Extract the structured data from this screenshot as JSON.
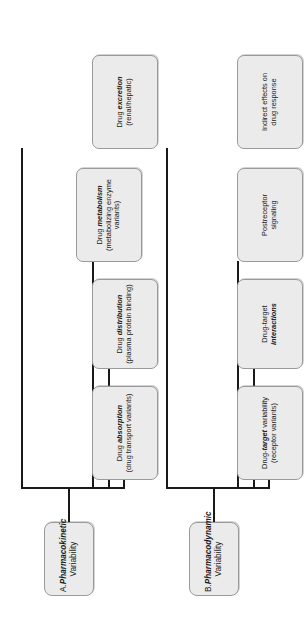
{
  "figure": {
    "orientation": "rotated-90-ccw",
    "box_fill": "#ebebeb",
    "box_border": "#9a9a9a",
    "line_color": "#1a1a1a",
    "background": "#ffffff"
  },
  "groups": [
    {
      "id": "A",
      "parent": {
        "label_prefix": "A.",
        "label_emphasis": "Pharmacokinetic",
        "label_rest": "Variability"
      },
      "children": [
        {
          "lead": "Drug ",
          "emphasis": "absorption",
          "sub": "(drug transport variants)"
        },
        {
          "lead": "Drug ",
          "emphasis": "distribution",
          "sub": "(plasma protein binding)"
        },
        {
          "lead": "Drug ",
          "emphasis": "metabolism",
          "sub": "(metabolizing enzyme variants)"
        },
        {
          "lead": "Drug ",
          "emphasis": "excretion",
          "sub": "(renal/hepatic)"
        }
      ]
    },
    {
      "id": "B",
      "parent": {
        "label_prefix": "B.",
        "label_emphasis": "Pharmacodynamic",
        "label_rest": "Variability"
      },
      "children": [
        {
          "lead": "Drug-",
          "emphasis": "target",
          "tail": " variability",
          "sub": "(receptor variants)"
        },
        {
          "lead": "Drug-target",
          "emphasis": "interactions",
          "sub": ""
        },
        {
          "lead": "Postreceptor",
          "emphasis": "",
          "sub": "signaling"
        },
        {
          "lead": "Indirect effects on",
          "emphasis": "",
          "sub": "drug response"
        }
      ]
    }
  ]
}
